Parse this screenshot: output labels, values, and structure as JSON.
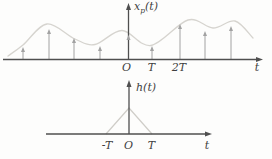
{
  "figure_title": "impulse-train sampling and triangular interpolation kernel",
  "colors": {
    "background": "#fdfdfc",
    "axis": "#4f4f4f",
    "impulse": "#a2a2a2",
    "envelope": "#d6d4cf",
    "triangle": "#cfcdc8",
    "label": "#3f3f3f"
  },
  "top_plot": {
    "y_label": {
      "base": "x",
      "sub": "p",
      "args": "(t)"
    },
    "tick_labels": {
      "origin": "O",
      "t1": "T",
      "t2": "2T"
    },
    "x_axis_label": "t",
    "axis": {
      "x_start": 3,
      "x_end": 263,
      "y": 59.5,
      "v_x": 128.5,
      "v_top": 3
    },
    "impulses": [
      {
        "x": 23,
        "tip": 47
      },
      {
        "x": 49,
        "tip": 29
      },
      {
        "x": 74,
        "tip": 38
      },
      {
        "x": 100,
        "tip": 46
      },
      {
        "x": 128.5,
        "tip": 35
      },
      {
        "x": 152,
        "tip": 46
      },
      {
        "x": 180,
        "tip": 24
      },
      {
        "x": 205,
        "tip": 31
      },
      {
        "x": 231,
        "tip": 26
      }
    ],
    "envelope": [
      [
        8,
        56
      ],
      [
        23,
        45
      ],
      [
        47,
        24
      ],
      [
        75,
        39
      ],
      [
        95,
        44.5
      ],
      [
        122,
        30.5
      ],
      [
        151,
        45.5
      ],
      [
        188,
        20
      ],
      [
        213,
        28
      ],
      [
        235,
        21
      ],
      [
        253,
        38
      ]
    ]
  },
  "bottom_plot": {
    "y_label": {
      "text": "h(t)"
    },
    "tick_labels": {
      "neg_t": "-T",
      "origin": "O",
      "t1": "T"
    },
    "x_axis_label": "t",
    "axis": {
      "x_start": 46,
      "x_end": 212,
      "y": 134,
      "v_x": 129,
      "v_top": 80
    },
    "triangle": {
      "left_x": 106,
      "peak_x": 129,
      "peak_y": 108,
      "right_x": 152
    }
  },
  "chart_data": [
    {
      "type": "line",
      "title": "x_p(t): impulse-train sampled signal with smooth envelope",
      "xlabel": "t",
      "x_ticks": [
        "O",
        "T",
        "2T"
      ],
      "impulse_positions_in_T": [
        -4,
        -3,
        -2,
        -1,
        0,
        1,
        2,
        3,
        4
      ],
      "impulse_heights_px": [
        12.5,
        30.5,
        21.5,
        13.5,
        24.5,
        13.5,
        35.5,
        28.5,
        33.5
      ],
      "legend": "none",
      "grid": false
    },
    {
      "type": "line",
      "title": "h(t): triangular interpolation kernel",
      "xlabel": "t",
      "x_ticks": [
        "-T",
        "O",
        "T"
      ],
      "triangle_base": [
        "-T",
        "T"
      ],
      "triangle_peak_at": "O",
      "legend": "none",
      "grid": false
    }
  ]
}
